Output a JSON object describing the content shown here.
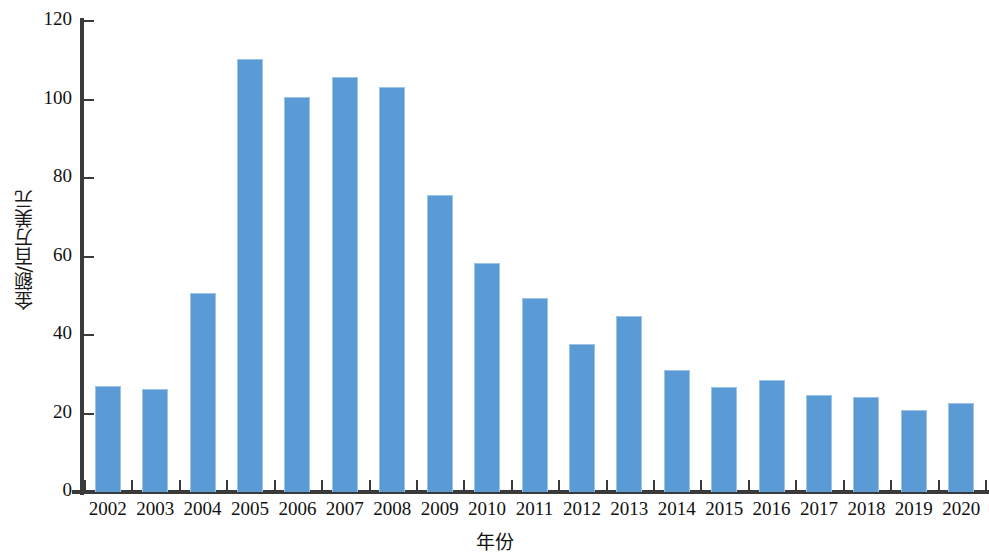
{
  "chart_data": {
    "type": "bar",
    "title": "",
    "xlabel": "年份",
    "ylabel": "金额/百万美元",
    "grid": false,
    "legend": null,
    "ylim": [
      0,
      120
    ],
    "ytick_labels": [
      "120",
      "100",
      "80",
      "60",
      "40",
      "20",
      "0"
    ],
    "ytick_values": [
      120,
      100,
      80,
      60,
      40,
      20,
      0
    ],
    "categories": [
      "2002",
      "2003",
      "2004",
      "2005",
      "2006",
      "2007",
      "2008",
      "2009",
      "2010",
      "2011",
      "2012",
      "2013",
      "2014",
      "2015",
      "2016",
      "2017",
      "2018",
      "2019",
      "2020"
    ],
    "values": [
      27.0,
      26.2,
      50.6,
      110.2,
      100.6,
      105.8,
      103.2,
      75.6,
      58.4,
      49.4,
      37.6,
      44.8,
      31.2,
      26.8,
      28.6,
      24.8,
      24.2,
      20.8,
      22.8
    ],
    "series": [
      {
        "name": "金额",
        "color": "#5A9BD5",
        "values": [
          27.0,
          26.2,
          50.6,
          110.2,
          100.6,
          105.8,
          103.2,
          75.6,
          58.4,
          49.4,
          37.6,
          44.8,
          31.2,
          26.8,
          28.6,
          24.8,
          24.2,
          20.8,
          22.8
        ]
      }
    ],
    "colors": {
      "bar_fill": "#5A9BD5",
      "bar_edge": "#9DC3E6",
      "axis": "#3A3A3A",
      "text": "#111111",
      "background": "#FFFFFF"
    }
  }
}
